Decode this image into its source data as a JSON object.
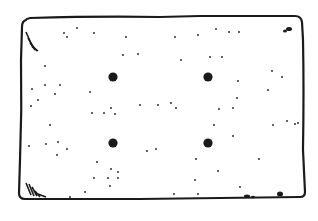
{
  "illustration": {
    "subject": "cracker",
    "stroke_color": "#1a1a1a",
    "fill_color": "#ffffff",
    "large_holes": [
      {
        "x": 113,
        "y": 77
      },
      {
        "x": 208,
        "y": 77
      },
      {
        "x": 113,
        "y": 143
      },
      {
        "x": 208,
        "y": 143
      }
    ],
    "small_dots": [
      [
        64,
        33
      ],
      [
        67,
        37
      ],
      [
        77,
        28
      ],
      [
        94,
        33
      ],
      [
        126,
        37
      ],
      [
        138,
        54
      ],
      [
        123,
        55
      ],
      [
        45,
        66
      ],
      [
        32,
        89
      ],
      [
        45,
        85
      ],
      [
        60,
        85
      ],
      [
        55,
        94
      ],
      [
        90,
        92
      ],
      [
        31,
        106
      ],
      [
        38,
        100
      ],
      [
        111,
        108
      ],
      [
        140,
        105
      ],
      [
        158,
        105
      ],
      [
        175,
        37
      ],
      [
        198,
        35
      ],
      [
        229,
        32
      ],
      [
        239,
        32
      ],
      [
        216,
        29
      ],
      [
        181,
        60
      ],
      [
        210,
        57
      ],
      [
        222,
        57
      ],
      [
        238,
        81
      ],
      [
        272,
        71
      ],
      [
        268,
        90
      ],
      [
        282,
        77
      ],
      [
        237,
        98
      ],
      [
        171,
        103
      ],
      [
        176,
        108
      ],
      [
        219,
        109
      ],
      [
        233,
        108
      ],
      [
        92,
        113
      ],
      [
        115,
        114
      ],
      [
        104,
        113
      ],
      [
        50,
        125
      ],
      [
        29,
        146
      ],
      [
        46,
        144
      ],
      [
        58,
        142
      ],
      [
        67,
        149
      ],
      [
        57,
        155
      ],
      [
        97,
        162
      ],
      [
        111,
        169
      ],
      [
        118,
        172
      ],
      [
        94,
        178
      ],
      [
        108,
        178
      ],
      [
        118,
        178
      ],
      [
        110,
        186
      ],
      [
        85,
        192
      ],
      [
        70,
        197
      ],
      [
        147,
        151
      ],
      [
        156,
        149
      ],
      [
        214,
        125
      ],
      [
        196,
        159
      ],
      [
        233,
        136
      ],
      [
        273,
        125
      ],
      [
        295,
        124
      ],
      [
        259,
        159
      ],
      [
        218,
        171
      ],
      [
        195,
        180
      ],
      [
        240,
        187
      ],
      [
        174,
        194
      ],
      [
        198,
        194
      ],
      [
        287,
        121
      ],
      [
        298,
        123
      ]
    ]
  }
}
